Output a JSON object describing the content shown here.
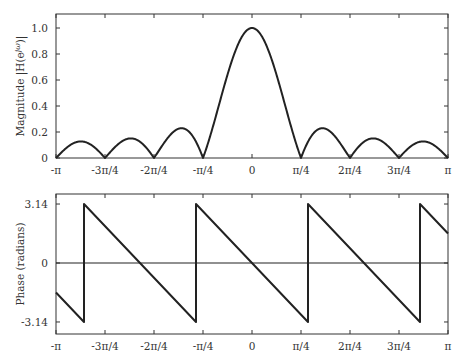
{
  "chart_data": [
    {
      "type": "line",
      "title": "",
      "xlabel": "",
      "ylabel": "Magnitude |H(e^{jω})|",
      "x_ticks": [
        "-π",
        "-3π/4",
        "-2π/4",
        "-π/4",
        "0",
        "π/4",
        "2π/4",
        "3π/4",
        "π"
      ],
      "y_ticks": [
        "0",
        "0.2",
        "0.4",
        "0.6",
        "0.8",
        "1.0"
      ],
      "xlim": [
        -3.14159,
        3.14159
      ],
      "ylim": [
        0,
        1.1
      ],
      "grid": false,
      "series": [
        {
          "name": "magnitude",
          "formula": "|sin(4ω) / (8 sin(ω/2))|",
          "x": [
            -3.1416,
            -2.7489,
            -2.3562,
            -1.9635,
            -1.5708,
            -1.1781,
            -0.7854,
            -0.3927,
            0,
            0.3927,
            0.7854,
            1.1781,
            1.5708,
            1.9635,
            2.3562,
            2.7489,
            3.1416
          ],
          "values": [
            0,
            0.127,
            0,
            0.15,
            0,
            0.226,
            0,
            0.653,
            1.0,
            0.653,
            0,
            0.226,
            0,
            0.15,
            0,
            0.127,
            0
          ]
        }
      ]
    },
    {
      "type": "line",
      "title": "",
      "xlabel": "",
      "ylabel": "Phase (radians)",
      "x_ticks": [
        "-π",
        "-3π/4",
        "-2π/4",
        "-π/4",
        "0",
        "π/4",
        "2π/4",
        "3π/4",
        "π"
      ],
      "y_ticks": [
        "-3.14",
        "0",
        "3.14"
      ],
      "xlim": [
        -3.14159,
        3.14159
      ],
      "ylim": [
        -3.4,
        3.4
      ],
      "grid": false,
      "annotations": [
        "horizontal line at 0"
      ],
      "series": [
        {
          "name": "phase",
          "formula": "wrap(-3.5ω) to [-π, π]",
          "x": [
            -3.1416,
            -2.6928,
            -2.6928,
            -0.8976,
            -0.8976,
            0,
            0.8976,
            0.8976,
            2.6928,
            2.6928,
            3.1416
          ],
          "values": [
            -1.571,
            -3.1416,
            3.1416,
            -3.1416,
            3.1416,
            0,
            -3.1416,
            3.1416,
            -3.1416,
            3.1416,
            1.571
          ]
        }
      ]
    }
  ]
}
